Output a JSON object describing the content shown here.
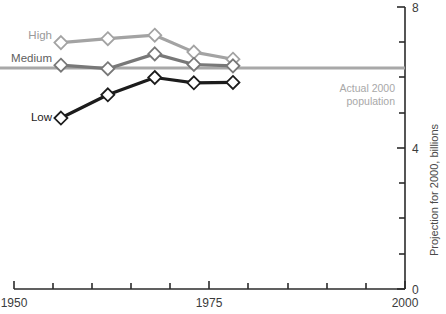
{
  "chart_data": {
    "type": "line",
    "title": "",
    "subtitle": "",
    "xlabel": "",
    "ylabel": "Projection for 2000, billions",
    "xlim": [
      1950,
      2000
    ],
    "ylim": [
      0,
      8
    ],
    "grid": false,
    "legend_position": "inline-left",
    "x_ticks": [
      1950,
      1955,
      1960,
      1965,
      1970,
      1975,
      1980,
      1985,
      1990,
      1995,
      2000
    ],
    "x_tick_labels": [
      "1950",
      "",
      "",
      "",
      "",
      "1975",
      "",
      "",
      "",
      "",
      "2000"
    ],
    "y_ticks": [
      0,
      1,
      2,
      3,
      4,
      5,
      6,
      7,
      8
    ],
    "y_tick_labels": [
      "0",
      "",
      "",
      "",
      "4",
      "",
      "",
      "",
      "8"
    ],
    "x": [
      1956,
      1962,
      1968,
      1973,
      1978
    ],
    "series": [
      {
        "name": "High",
        "label": "High",
        "color": "#a3a3a3",
        "marker": "diamond",
        "values": [
          6.99,
          7.1,
          7.2,
          6.72,
          6.52
        ]
      },
      {
        "name": "Medium",
        "label": "Medium",
        "color": "#787878",
        "marker": "diamond",
        "values": [
          6.35,
          6.25,
          6.67,
          6.37,
          6.33
        ]
      },
      {
        "name": "Low",
        "label": "Low",
        "color": "#1c1c1c",
        "marker": "diamond",
        "values": [
          4.85,
          5.51,
          6.0,
          5.85,
          5.86
        ]
      }
    ],
    "reference_line": {
      "name": "actual-2000-population",
      "value": 6.27,
      "label_line1": "Actual 2000",
      "label_line2": "population",
      "color": "#a8a8a8"
    },
    "axis_color": "#2b2b2b"
  }
}
